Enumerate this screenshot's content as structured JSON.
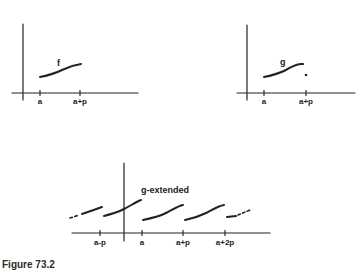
{
  "figure": {
    "caption": "Figure 73.2",
    "panels": [
      {
        "id": "f-panel",
        "function_label": "f",
        "ticks": [
          "a",
          "a+p"
        ]
      },
      {
        "id": "g-panel",
        "function_label": "g",
        "ticks": [
          "a",
          "a+p"
        ],
        "note": "isolated point at x = a+p"
      },
      {
        "id": "g-extended-panel",
        "function_label": "g-extended",
        "ticks": [
          "a-p",
          "a",
          "a+p",
          "a+2p"
        ]
      }
    ]
  }
}
